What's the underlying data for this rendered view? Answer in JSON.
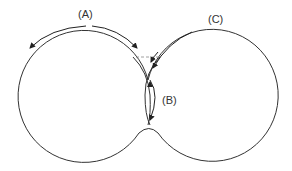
{
  "diagram": {
    "labels": {
      "a": "(A)",
      "b": "(B)",
      "c": "(C)"
    },
    "colors": {
      "stroke": "#333333",
      "dashed": "#888888",
      "background": "#ffffff"
    }
  }
}
